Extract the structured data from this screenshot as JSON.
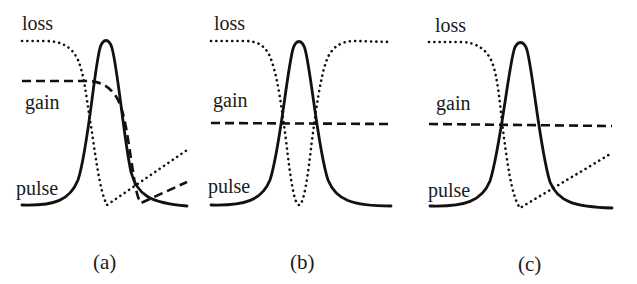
{
  "figure": {
    "panels": [
      {
        "id": "a",
        "caption": "(a)",
        "labels": {
          "loss": "loss",
          "gain": "gain",
          "pulse": "pulse"
        },
        "description": "Saturable loss drops and recovers linearly; gain saturates during pulse and recovers"
      },
      {
        "id": "b",
        "caption": "(b)",
        "labels": {
          "loss": "loss",
          "gain": "gain",
          "pulse": "pulse"
        },
        "description": "Loss symmetric dip around pulse with fast recovery; gain constant"
      },
      {
        "id": "c",
        "caption": "(c)",
        "labels": {
          "loss": "loss",
          "gain": "gain",
          "pulse": "pulse"
        },
        "description": "Loss drops and recovers linearly; gain constant"
      }
    ],
    "legend_styles": {
      "loss": "dotted",
      "gain": "dashed",
      "pulse": "solid"
    },
    "colors": {
      "line": "#111111",
      "text": "#1a1a1a",
      "background": "#ffffff"
    }
  }
}
